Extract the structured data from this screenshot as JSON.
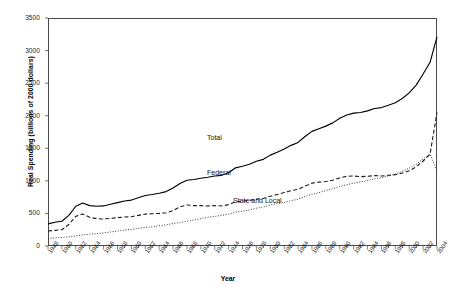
{
  "chart_data": {
    "type": "line",
    "title": "",
    "xlabel": "Year",
    "ylabel": "Real Spending (billions of 2000 dollars)",
    "ylim": [
      0,
      3500
    ],
    "yticks": [
      0,
      500,
      1000,
      1500,
      2000,
      2500,
      3000,
      3500
    ],
    "xlim": [
      1948,
      2004
    ],
    "grid": false,
    "legend_position": "inline-annotations",
    "categories": [
      1948,
      1949,
      1950,
      1951,
      1952,
      1953,
      1954,
      1955,
      1956,
      1957,
      1958,
      1959,
      1960,
      1961,
      1962,
      1963,
      1964,
      1965,
      1966,
      1967,
      1968,
      1969,
      1970,
      1971,
      1972,
      1973,
      1974,
      1975,
      1976,
      1977,
      1978,
      1979,
      1980,
      1981,
      1982,
      1983,
      1984,
      1985,
      1986,
      1987,
      1988,
      1989,
      1990,
      1991,
      1992,
      1993,
      1994,
      1995,
      1996,
      1997,
      1998,
      1999,
      2000,
      2001,
      2002,
      2003,
      2004
    ],
    "xticks": [
      1948,
      1950,
      1952,
      1954,
      1956,
      1958,
      1960,
      1962,
      1964,
      1966,
      1968,
      1970,
      1972,
      1974,
      1976,
      1978,
      1980,
      1982,
      1984,
      1986,
      1988,
      1990,
      1992,
      1994,
      1996,
      1998,
      2000,
      2002,
      2004
    ],
    "series": [
      {
        "name": "Total",
        "style": "solid",
        "values": [
          340,
          365,
          380,
          470,
          610,
          660,
          620,
          610,
          615,
          640,
          665,
          690,
          705,
          740,
          775,
          790,
          810,
          835,
          890,
          960,
          1010,
          1020,
          1040,
          1055,
          1075,
          1085,
          1125,
          1200,
          1225,
          1255,
          1300,
          1330,
          1395,
          1440,
          1490,
          1545,
          1590,
          1680,
          1760,
          1800,
          1840,
          1890,
          1960,
          2010,
          2040,
          2050,
          2075,
          2110,
          2125,
          2160,
          2200,
          2265,
          2350,
          2470,
          2640,
          2820,
          3210
        ]
      },
      {
        "name": "Federal",
        "style": "dashed",
        "values": [
          230,
          240,
          250,
          330,
          455,
          490,
          440,
          420,
          415,
          425,
          435,
          445,
          450,
          470,
          490,
          495,
          500,
          510,
          545,
          600,
          630,
          620,
          620,
          615,
          620,
          615,
          635,
          680,
          690,
          700,
          720,
          730,
          765,
          790,
          820,
          850,
          870,
          920,
          965,
          980,
          990,
          1010,
          1045,
          1070,
          1075,
          1065,
          1070,
          1080,
          1075,
          1085,
          1095,
          1120,
          1155,
          1215,
          1305,
          1410,
          2050
        ]
      },
      {
        "name": "State and Local",
        "style": "dotted",
        "values": [
          110,
          125,
          130,
          140,
          155,
          170,
          180,
          190,
          200,
          215,
          230,
          245,
          255,
          270,
          285,
          295,
          310,
          325,
          345,
          360,
          380,
          400,
          420,
          440,
          455,
          470,
          490,
          520,
          535,
          555,
          580,
          600,
          630,
          650,
          670,
          695,
          720,
          760,
          795,
          820,
          850,
          880,
          915,
          940,
          965,
          985,
          1005,
          1030,
          1050,
          1075,
          1105,
          1145,
          1195,
          1255,
          1335,
          1410,
          1160
        ]
      }
    ]
  }
}
